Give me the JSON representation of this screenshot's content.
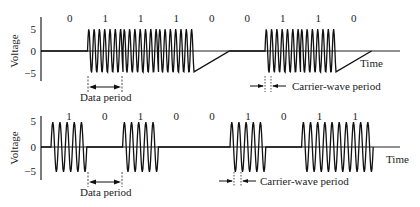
{
  "chart_data": [
    {
      "type": "line",
      "title": "Amplitude-shift keyed signal (constant carrier, dense)",
      "ylabel": "Voltage",
      "xlabel": "Time",
      "yticks": [
        "5",
        "0",
        "−5"
      ],
      "ylim": [
        -5,
        5
      ],
      "bits": [
        "0",
        "1",
        "1",
        "1",
        "0",
        "0",
        "1",
        "1",
        "0"
      ],
      "cycles_per_bit": 6.7,
      "annotations": [
        "Data period",
        "Carrier-wave period"
      ]
    },
    {
      "type": "line",
      "title": "Amplitude-shift keyed signal (sparser carrier)",
      "ylabel": "Voltage",
      "xlabel": "Time",
      "yticks": [
        "5",
        "0",
        "−5"
      ],
      "ylim": [
        -5,
        5
      ],
      "bits": [
        "1",
        "0",
        "1",
        "0",
        "0",
        "1",
        "0",
        "1",
        "1"
      ],
      "cycles_per_bit": 5,
      "annotations": [
        "Data period",
        "Carrier-wave period"
      ]
    }
  ],
  "top": {
    "ylabel": "Voltage",
    "xlabel": "Time",
    "tick_pos": "5",
    "tick_zero": "0",
    "tick_neg": "−5",
    "data_period": "Data period",
    "carrier_period": "Carrier-wave period"
  },
  "bottom": {
    "ylabel": "Voltage",
    "xlabel": "Time",
    "tick_pos": "5",
    "tick_zero": "0",
    "tick_neg": "−5",
    "data_period": "Data period",
    "carrier_period": "Carrier-wave period"
  }
}
